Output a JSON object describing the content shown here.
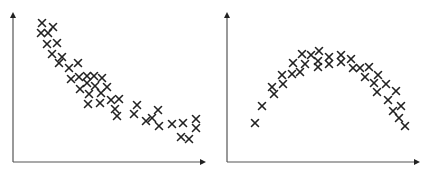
{
  "style": {
    "axis_color": "#555555",
    "marker_color": "#222222",
    "background": "#ffffff"
  },
  "chart_data": [
    {
      "type": "scatter",
      "title": "",
      "xlabel": "",
      "ylabel": "",
      "marker": "x",
      "grid": false,
      "legend": null,
      "description": "Decreasing (convex) trend",
      "axis": {
        "origin_px": [
          13,
          162
        ],
        "x_end_px": 206,
        "y_end_px": 12
      },
      "points_px": [
        [
          42,
          23
        ],
        [
          41,
          33
        ],
        [
          48,
          33
        ],
        [
          53,
          27
        ],
        [
          47,
          44
        ],
        [
          57,
          43
        ],
        [
          52,
          54
        ],
        [
          62,
          57
        ],
        [
          59,
          63
        ],
        [
          69,
          68
        ],
        [
          78,
          63
        ],
        [
          71,
          79
        ],
        [
          79,
          77
        ],
        [
          87,
          76
        ],
        [
          94,
          76
        ],
        [
          102,
          78
        ],
        [
          87,
          83
        ],
        [
          95,
          86
        ],
        [
          80,
          89
        ],
        [
          107,
          87
        ],
        [
          89,
          94
        ],
        [
          101,
          93
        ],
        [
          111,
          100
        ],
        [
          119,
          99
        ],
        [
          88,
          104
        ],
        [
          100,
          103
        ],
        [
          115,
          109
        ],
        [
          117,
          116
        ],
        [
          137,
          105
        ],
        [
          134,
          114
        ],
        [
          158,
          110
        ],
        [
          146,
          121
        ],
        [
          152,
          118
        ],
        [
          159,
          126
        ],
        [
          172,
          124
        ],
        [
          183,
          123
        ],
        [
          196,
          119
        ],
        [
          196,
          128
        ],
        [
          181,
          137
        ],
        [
          189,
          139
        ]
      ]
    },
    {
      "type": "scatter",
      "title": "",
      "xlabel": "",
      "ylabel": "",
      "marker": "x",
      "grid": false,
      "legend": null,
      "description": "Inverted-U (concave) trend",
      "axis": {
        "origin_px": [
          13,
          162
        ],
        "x_end_px": 206,
        "y_end_px": 12
      },
      "points_px": [
        [
          41,
          123
        ],
        [
          48,
          106
        ],
        [
          58,
          87
        ],
        [
          60,
          94
        ],
        [
          68,
          75
        ],
        [
          69,
          84
        ],
        [
          79,
          63
        ],
        [
          78,
          74
        ],
        [
          86,
          72
        ],
        [
          88,
          54
        ],
        [
          91,
          64
        ],
        [
          97,
          55
        ],
        [
          105,
          51
        ],
        [
          104,
          61
        ],
        [
          104,
          67
        ],
        [
          115,
          57
        ],
        [
          115,
          64
        ],
        [
          127,
          55
        ],
        [
          127,
          62
        ],
        [
          137,
          59
        ],
        [
          139,
          68
        ],
        [
          146,
          68
        ],
        [
          155,
          67
        ],
        [
          151,
          77
        ],
        [
          164,
          75
        ],
        [
          160,
          83
        ],
        [
          172,
          84
        ],
        [
          163,
          92
        ],
        [
          182,
          91
        ],
        [
          174,
          100
        ],
        [
          179,
          111
        ],
        [
          187,
          106
        ],
        [
          185,
          118
        ],
        [
          191,
          126
        ]
      ]
    }
  ]
}
